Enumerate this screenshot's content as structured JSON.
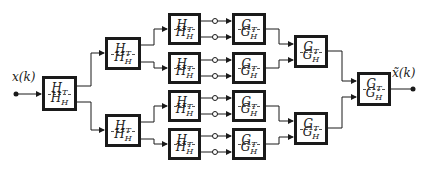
{
  "diagram": {
    "type": "filter-bank-analysis-synthesis-tree",
    "input_label": "x(k)",
    "output_label": "x̃(k)",
    "analysis_box": {
      "top_letter": "H",
      "top_sub": "T",
      "bottom_letter": "H",
      "bottom_sub": "H"
    },
    "synthesis_box": {
      "top_letter": "G",
      "top_sub": "T",
      "bottom_letter": "G",
      "bottom_sub": "H"
    },
    "levels": {
      "analysis": [
        1,
        2,
        4
      ],
      "synthesis": [
        4,
        2,
        1
      ]
    },
    "colors": {
      "stroke": "#1a1a1a",
      "background": "#ffffff"
    }
  }
}
